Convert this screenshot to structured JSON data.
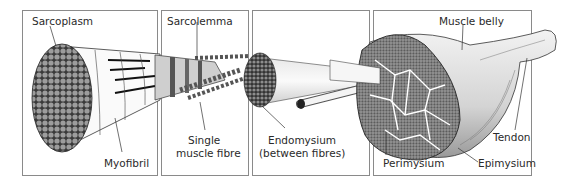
{
  "diagram": {
    "panels": [
      {
        "id": "myofibril-panel",
        "labels": [
          "Sarcoplasm",
          "Myofibril"
        ]
      },
      {
        "id": "fibre-panel",
        "labels": [
          "Sarcolemma",
          "Single",
          "muscle fibre"
        ]
      },
      {
        "id": "fascicle-panel",
        "labels": [
          "Endomysium",
          "(between fibres)"
        ]
      },
      {
        "id": "muscle-panel",
        "labels": [
          "Muscle belly",
          "Tendon",
          "Perimysium",
          "Epimysium"
        ]
      }
    ],
    "labels": {
      "sarcoplasm": "Sarcoplasm",
      "myofibril": "Myofibril",
      "sarcolemma": "Sarcolemma",
      "single_fibre_line1": "Single",
      "single_fibre_line2": "muscle fibre",
      "endomysium_line1": "Endomysium",
      "endomysium_line2": "(between fibres)",
      "muscle_belly": "Muscle belly",
      "tendon": "Tendon",
      "perimysium": "Perimysium",
      "epimysium": "Epimysium"
    },
    "colors": {
      "panel_border": "#8a8a8a",
      "ink": "#2a2a2a",
      "fibre_gray": "#9a9a9a",
      "dark_gray": "#555555",
      "light_gray": "#d8d8d8"
    }
  }
}
